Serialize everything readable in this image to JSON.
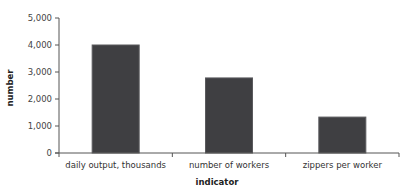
{
  "chart_data": {
    "type": "bar",
    "title": "",
    "xlabel": "indicator",
    "ylabel": "number",
    "categories": [
      "daily output, thousands",
      "number of workers",
      "zippers per worker"
    ],
    "values": [
      4000,
      2780,
      1330
    ],
    "ylim": [
      0,
      5000
    ],
    "yticks": [
      0,
      1000,
      2000,
      3000,
      4000,
      5000
    ],
    "ytick_labels": [
      "0",
      "1,000",
      "2,000",
      "3,000",
      "4,000",
      "5,000"
    ],
    "grid": false,
    "legend": null,
    "bar_color": "#3f3f42"
  },
  "axes": {
    "x_title": "indicator",
    "y_title": "number"
  }
}
